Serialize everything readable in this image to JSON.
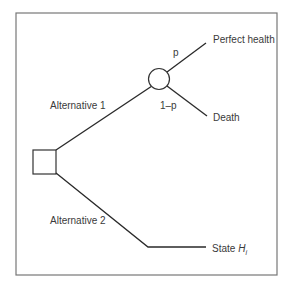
{
  "diagram": {
    "type": "decision-tree",
    "decision_node": {
      "shape": "square"
    },
    "chance_node": {
      "shape": "circle"
    },
    "branches": {
      "alternative_1": "Alternative 1",
      "alternative_2": "Alternative 2",
      "prob_p": "p",
      "prob_1_minus_p": "1–p"
    },
    "outcomes": {
      "perfect_health": "Perfect health",
      "death": "Death",
      "state_prefix": "State ",
      "state_var": "H",
      "state_sub": "i"
    },
    "colors": {
      "line": "#2a2a2a",
      "frame": "#6a6a6a",
      "text": "#3a3a3a"
    }
  }
}
